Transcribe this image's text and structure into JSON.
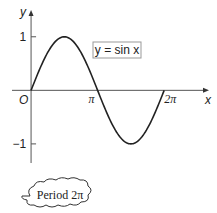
{
  "chart_data": {
    "type": "line",
    "title": "",
    "function_label": "y = sin x",
    "xlabel": "x",
    "ylabel": "y",
    "origin_label": "O",
    "x_ticks": [
      {
        "value": 3.14159,
        "label": "π"
      },
      {
        "value": 6.28318,
        "label": "2π"
      }
    ],
    "y_ticks": [
      {
        "value": 1,
        "label": "1"
      },
      {
        "value": -1,
        "label": "−1"
      }
    ],
    "xlim": [
      -0.9,
      8.4
    ],
    "ylim": [
      -1.45,
      1.5
    ],
    "grid": false,
    "series": [
      {
        "name": "y = sin x",
        "function": "sin",
        "x_start": 0,
        "x_end": 6.28318,
        "color": "#222222"
      }
    ],
    "annotation": "Period 2π"
  }
}
